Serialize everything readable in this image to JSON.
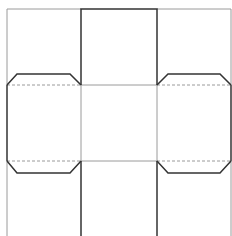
{
  "diagram": {
    "type": "box-net-dieline",
    "colors": {
      "background": "#ffffff",
      "cut_line": "#333333",
      "fold_line": "#9a9a9a"
    },
    "panels": [
      {
        "id": "top-center",
        "label": ""
      },
      {
        "id": "middle-left",
        "label": ""
      },
      {
        "id": "middle-center",
        "label": ""
      },
      {
        "id": "middle-right",
        "label": ""
      },
      {
        "id": "bottom-center",
        "label": ""
      }
    ],
    "flaps": [
      {
        "id": "flap-top-left"
      },
      {
        "id": "flap-top-right"
      },
      {
        "id": "flap-bottom-left"
      },
      {
        "id": "flap-bottom-right"
      }
    ]
  }
}
